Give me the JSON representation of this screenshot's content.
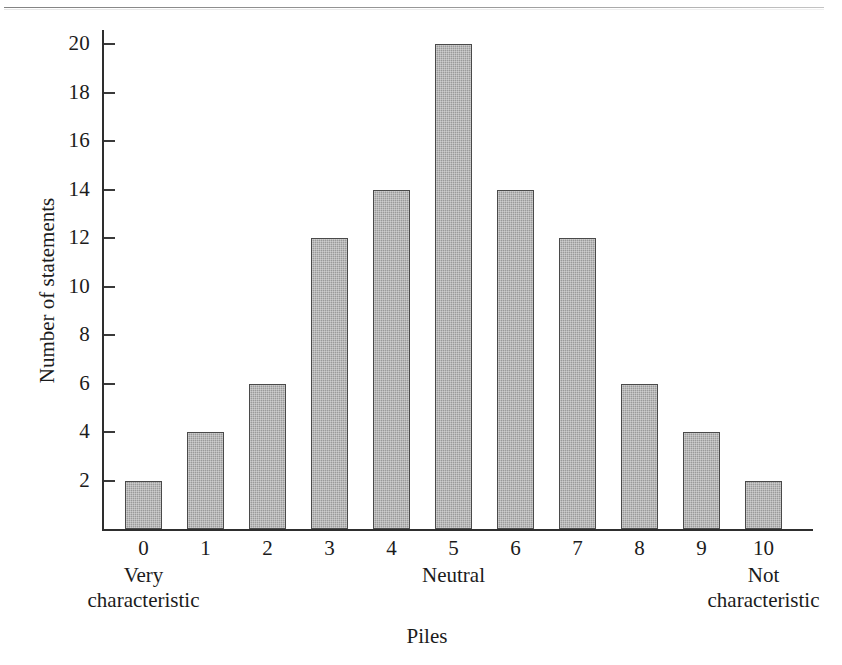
{
  "chart_data": {
    "type": "bar",
    "title": "",
    "xlabel": "Piles",
    "ylabel": "Number of statements",
    "categories": [
      "0",
      "1",
      "2",
      "3",
      "4",
      "5",
      "6",
      "7",
      "8",
      "9",
      "10"
    ],
    "values": [
      2,
      4,
      6,
      12,
      14,
      20,
      14,
      12,
      6,
      4,
      2
    ],
    "ylim": [
      0,
      20
    ],
    "ytick_labels": [
      "2",
      "4",
      "6",
      "8",
      "10",
      "12",
      "14",
      "16",
      "18",
      "20"
    ],
    "ytick_values": [
      2,
      4,
      6,
      8,
      10,
      12,
      14,
      16,
      18,
      20
    ],
    "grid": false,
    "legend": null,
    "bar_color": "#9a9a9a",
    "bar_edge_color": "#4a4a4a",
    "axis_color": "#2e2e2e",
    "background_color": "#ffffff",
    "annotations": [
      {
        "text_line1": "Very",
        "text_line2": "characteristic",
        "at_category": "0"
      },
      {
        "text_line1": "Neutral",
        "text_line2": "",
        "at_category": "5"
      },
      {
        "text_line1": "Not",
        "text_line2": "characteristic",
        "at_category": "10"
      }
    ]
  },
  "axes": {
    "y_title": "Number of statements",
    "x_title": "Piles"
  },
  "anchors": {
    "left_line1": "Very",
    "left_line2": "characteristic",
    "middle_line1": "Neutral",
    "right_line1": "Not",
    "right_line2": "characteristic"
  }
}
